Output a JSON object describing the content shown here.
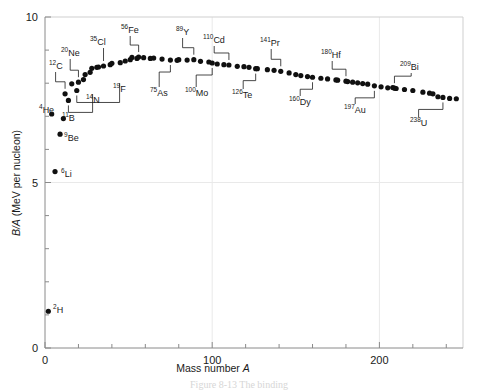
{
  "figure": {
    "ylabel_italic": "B/A",
    "ylabel_rest": "(MeV per nucleon)",
    "xlabel_rest": "Mass number",
    "xlabel_italic": "A",
    "caption_partial": "Figure  8-13   The binding"
  },
  "chart_data": {
    "type": "scatter",
    "title": "",
    "xlabel": "Mass number A",
    "ylabel": "B/A (MeV per nucleon)",
    "xlim": [
      0,
      250
    ],
    "ylim": [
      0,
      10
    ],
    "xticks": [
      0,
      100,
      200
    ],
    "xticklabels": [
      "0",
      "100",
      "200"
    ],
    "xminor_step": 20,
    "yticks": [
      0,
      5,
      10
    ],
    "yticklabels": [
      "0",
      "5",
      "10"
    ],
    "yminor_step": 1,
    "grid": "faint",
    "legend": "none",
    "x": [
      2,
      4,
      6,
      9,
      11,
      12,
      14,
      16,
      19,
      20,
      23,
      24,
      27,
      28,
      31,
      32,
      35,
      39,
      40,
      45,
      48,
      51,
      52,
      55,
      56,
      59,
      63,
      65,
      70,
      75,
      79,
      80,
      85,
      89,
      93,
      98,
      100,
      103,
      107,
      110,
      115,
      119,
      122,
      126,
      127,
      133,
      137,
      141,
      146,
      150,
      153,
      157,
      160,
      165,
      169,
      174,
      175,
      180,
      181,
      184,
      187,
      190,
      193,
      197,
      201,
      205,
      208,
      209,
      210,
      215,
      220,
      226,
      230,
      232,
      235,
      238,
      242,
      246
    ],
    "y": [
      1.11,
      7.07,
      5.33,
      6.46,
      6.93,
      7.68,
      7.48,
      7.98,
      7.78,
      8.03,
      8.11,
      8.26,
      8.33,
      8.45,
      8.48,
      8.49,
      8.52,
      8.56,
      8.6,
      8.62,
      8.67,
      8.71,
      8.78,
      8.75,
      8.79,
      8.77,
      8.75,
      8.76,
      8.73,
      8.7,
      8.69,
      8.71,
      8.7,
      8.71,
      8.66,
      8.64,
      8.61,
      8.58,
      8.56,
      8.55,
      8.51,
      8.5,
      8.48,
      8.44,
      8.44,
      8.41,
      8.39,
      8.36,
      8.31,
      8.26,
      8.23,
      8.2,
      8.18,
      8.15,
      8.13,
      8.1,
      8.09,
      8.06,
      8.05,
      8.03,
      8.01,
      7.99,
      7.97,
      7.92,
      7.89,
      7.86,
      7.87,
      7.85,
      7.84,
      7.81,
      7.78,
      7.73,
      7.7,
      7.68,
      7.59,
      7.57,
      7.54,
      7.53
    ],
    "annotations": [
      {
        "sup": "2",
        "el": "H",
        "a": 2,
        "ba": 1.11,
        "lx": 53,
        "ly": 313,
        "leader": false
      },
      {
        "sup": "4",
        "el": "He",
        "a": 4,
        "ba": 7.07,
        "lx": 39,
        "ly": 113,
        "leader": false
      },
      {
        "sup": "6",
        "el": "Li",
        "a": 6,
        "ba": 5.33,
        "lx": 61,
        "ly": 177,
        "leader": false
      },
      {
        "sup": "9",
        "el": "Be",
        "a": 9,
        "ba": 6.46,
        "lx": 64,
        "ly": 141,
        "leader": false
      },
      {
        "sup": "11",
        "el": "B",
        "a": 11,
        "ba": 6.93,
        "lx": 62,
        "ly": 121,
        "leader": false
      },
      {
        "sup": "12",
        "el": "C",
        "a": 12,
        "ba": 7.68,
        "lx": 49,
        "ly": 69,
        "leader": true
      },
      {
        "sup": "14",
        "el": "N",
        "a": 14,
        "ba": 7.48,
        "lx": 86,
        "ly": 103,
        "leader": true
      },
      {
        "sup": "19",
        "el": "F",
        "a": 19,
        "ba": 7.78,
        "lx": 113,
        "ly": 92,
        "leader": true
      },
      {
        "sup": "20",
        "el": "Ne",
        "a": 20,
        "ba": 8.03,
        "lx": 61,
        "ly": 56,
        "leader": true
      },
      {
        "sup": "35",
        "el": "Cl",
        "a": 35,
        "ba": 8.52,
        "lx": 90,
        "ly": 45,
        "leader": true
      },
      {
        "sup": "56",
        "el": "Fe",
        "a": 56,
        "ba": 8.79,
        "lx": 121,
        "ly": 33,
        "leader": true
      },
      {
        "sup": "75",
        "el": "As",
        "a": 75,
        "ba": 8.7,
        "lx": 150,
        "ly": 96,
        "leader": true
      },
      {
        "sup": "89",
        "el": "Y",
        "a": 89,
        "ba": 8.71,
        "lx": 176,
        "ly": 35,
        "leader": true
      },
      {
        "sup": "100",
        "el": "Mo",
        "a": 100,
        "ba": 8.61,
        "lx": 185,
        "ly": 96,
        "leader": true
      },
      {
        "sup": "110",
        "el": "Cd",
        "a": 110,
        "ba": 8.55,
        "lx": 203,
        "ly": 43,
        "leader": true
      },
      {
        "sup": "126",
        "el": "Te",
        "a": 126,
        "ba": 8.44,
        "lx": 232,
        "ly": 98,
        "leader": true
      },
      {
        "sup": "141",
        "el": "Pr",
        "a": 141,
        "ba": 8.36,
        "lx": 260,
        "ly": 46,
        "leader": true
      },
      {
        "sup": "160",
        "el": "Dy",
        "a": 160,
        "ba": 8.18,
        "lx": 289,
        "ly": 105,
        "leader": true
      },
      {
        "sup": "180",
        "el": "Hf",
        "a": 180,
        "ba": 8.06,
        "lx": 321,
        "ly": 58,
        "leader": true
      },
      {
        "sup": "197",
        "el": "Au",
        "a": 197,
        "ba": 7.92,
        "lx": 344,
        "ly": 113,
        "leader": true
      },
      {
        "sup": "209",
        "el": "Bi",
        "a": 209,
        "ba": 7.85,
        "lx": 400,
        "ly": 70,
        "leader": true
      },
      {
        "sup": "238",
        "el": "U",
        "a": 238,
        "ba": 7.57,
        "lx": 410,
        "ly": 126,
        "leader": true
      }
    ]
  }
}
